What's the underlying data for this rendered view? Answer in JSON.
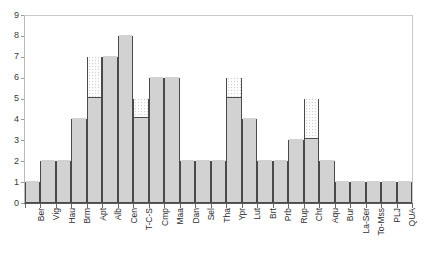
{
  "chart_data": {
    "type": "bar",
    "title": "",
    "subtitle": "",
    "xlabel": "",
    "ylabel": "",
    "ylim": [
      0,
      9
    ],
    "grid": false,
    "legend": "none",
    "stacked": true,
    "y_ticks": [
      "0",
      "1",
      "2",
      "3",
      "4",
      "5",
      "6",
      "7",
      "8",
      "9"
    ],
    "categories": [
      "Ber",
      "Vig",
      "Hau",
      "Brm",
      "Apt",
      "Alb",
      "Cen",
      "T-C-S",
      "Cmp",
      "Maa",
      "Dan",
      "Sel",
      "Tha",
      "Ypr",
      "Lut",
      "Brt",
      "Prb",
      "Rup",
      "Cht",
      "Aqu",
      "Bur",
      "La-Ser",
      "To-Mss",
      "PLJ",
      "QUA"
    ],
    "series": [
      {
        "name": "solid",
        "values": [
          1,
          2,
          2,
          4,
          5,
          7,
          8,
          4,
          6,
          6,
          2,
          2,
          2,
          5,
          4,
          2,
          2,
          3,
          3,
          2,
          1,
          1,
          1,
          1,
          1
        ]
      },
      {
        "name": "hatched",
        "values": [
          0,
          0,
          0,
          0,
          2,
          0,
          0,
          1,
          0,
          0,
          0,
          0,
          0,
          1,
          0,
          0,
          0,
          0,
          2,
          0,
          0,
          0,
          0,
          0,
          0
        ]
      }
    ],
    "totals": [
      1,
      2,
      2,
      4,
      7,
      7,
      8,
      5,
      6,
      6,
      2,
      2,
      2,
      6,
      4,
      2,
      2,
      3,
      5,
      2,
      1,
      1,
      1,
      1,
      1
    ],
    "colors": {
      "solid_fill": "#d2d2d2",
      "hatched_fill": "#fbfbfb",
      "bar_outline": "#4a4a4a",
      "axis": "#5a5a5a",
      "text": "#2e2e2e"
    }
  }
}
